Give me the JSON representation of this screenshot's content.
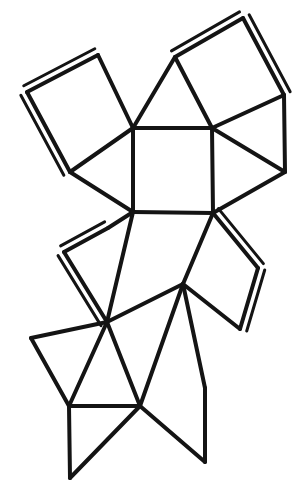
{
  "figure": {
    "canvas": {
      "width": 303,
      "height": 496
    },
    "background_color": "#ffffff",
    "line_color": "#141414",
    "line_width": 4,
    "flap_line_width": 3,
    "flap_offset": 7,
    "vertices": {
      "c_tl": [
        133,
        128
      ],
      "c_tr": [
        212,
        128
      ],
      "c_br": [
        213,
        213
      ],
      "c_bl": [
        133,
        212
      ],
      "tl_left": [
        27,
        92
      ],
      "tl_top": [
        98,
        55
      ],
      "tl_bottom": [
        70,
        172
      ],
      "tri_top_apex": [
        175,
        57
      ],
      "tr_top": [
        243,
        18
      ],
      "tr_right": [
        284,
        95
      ],
      "tr_bottom_right": [
        285,
        172
      ],
      "ml_left": [
        64,
        252
      ],
      "ml_top": [
        108,
        228
      ],
      "ml_bottom": [
        110,
        322
      ],
      "mid_left_hub": [
        107,
        322
      ],
      "mr_right": [
        258,
        268
      ],
      "mr_bottom": [
        240,
        329
      ],
      "low_hub": [
        183,
        284
      ],
      "bl_left": [
        31,
        338
      ],
      "bl_bottom": [
        69,
        406
      ],
      "bot_hub": [
        140,
        406
      ],
      "bot_left_pt": [
        70,
        478
      ],
      "bot_right_apex": [
        205,
        388
      ],
      "bot_right_low": [
        205,
        462
      ],
      "bot_mid": [
        140,
        462
      ]
    },
    "faces": [
      {
        "name": "central-square",
        "kind": "square",
        "points": "133,128 212,128 213,213 133,212"
      },
      {
        "name": "top-left-square-flap",
        "kind": "square-flap",
        "points": "27,92 98,55 133,128 70,172"
      },
      {
        "name": "top-triangle",
        "kind": "triangle",
        "points": "133,128 175,57 212,128"
      },
      {
        "name": "top-right-square-flap",
        "kind": "square-flap",
        "points": "175,57 243,18 284,95 212,128"
      },
      {
        "name": "right-triangle",
        "kind": "triangle",
        "points": "212,128 284,95 285,172"
      },
      {
        "name": "right-lower-triangle",
        "kind": "triangle",
        "points": "212,128 285,172 213,213"
      },
      {
        "name": "left-triangle",
        "kind": "triangle",
        "points": "70,172 133,128 133,212"
      },
      {
        "name": "mid-left-square-flap",
        "kind": "square-flap",
        "points": "64,252 108,228 133,212 107,322"
      },
      {
        "name": "mid-right-square-flap",
        "kind": "square-flap",
        "points": "213,213 258,268 240,329 183,284"
      },
      {
        "name": "lower-left-triangle",
        "kind": "triangle",
        "points": "107,322 133,212 183,284"
      },
      {
        "name": "lower-mid-triangle",
        "kind": "triangle",
        "points": "107,322 183,284 140,406"
      },
      {
        "name": "bottom-left-triangle",
        "kind": "triangle",
        "points": "31,338 107,322 69,406"
      },
      {
        "name": "bottom-small-triangle",
        "kind": "triangle",
        "points": "69,406 107,322 140,406"
      },
      {
        "name": "bottom-left-lower-triangle",
        "kind": "triangle",
        "points": "69,406 140,406 70,478"
      },
      {
        "name": "bottom-right-triangle",
        "kind": "triangle",
        "points": "140,406 183,284 205,388"
      },
      {
        "name": "bottom-right-lower-triangle",
        "kind": "triangle",
        "points": "140,406 205,388 205,462"
      }
    ],
    "edges": [
      {
        "name": "central-square-top",
        "path": "133,128 212,128"
      },
      {
        "name": "central-square-right",
        "path": "212,128 213,213"
      },
      {
        "name": "central-square-bottom",
        "path": "213,213 133,212"
      },
      {
        "name": "central-square-left",
        "path": "133,212 133,128"
      },
      {
        "name": "tl-square-a",
        "path": "27,92 98,55"
      },
      {
        "name": "tl-square-b",
        "path": "98,55 133,128"
      },
      {
        "name": "tl-square-c",
        "path": "133,128 70,172"
      },
      {
        "name": "tl-square-d",
        "path": "70,172 27,92"
      },
      {
        "name": "tl-left-triangle-edge",
        "path": "70,172 133,212"
      },
      {
        "name": "top-triangle-left",
        "path": "133,128 175,57"
      },
      {
        "name": "top-triangle-right",
        "path": "175,57 212,128"
      },
      {
        "name": "tr-square-a",
        "path": "175,57 243,18"
      },
      {
        "name": "tr-square-b",
        "path": "243,18 284,95"
      },
      {
        "name": "tr-square-c",
        "path": "284,95 212,128"
      },
      {
        "name": "right-triangle-outer",
        "path": "284,95 285,172"
      },
      {
        "name": "right-triangle-lower",
        "path": "285,172 213,213"
      },
      {
        "name": "right-triangle-diag",
        "path": "212,128 285,172"
      },
      {
        "name": "ml-square-a",
        "path": "133,212 108,228"
      },
      {
        "name": "ml-square-b",
        "path": "108,228 64,252"
      },
      {
        "name": "ml-square-c",
        "path": "64,252 107,322"
      },
      {
        "name": "ml-square-d",
        "path": "107,322 133,212"
      },
      {
        "name": "mr-square-a",
        "path": "213,213 258,268"
      },
      {
        "name": "mr-square-b",
        "path": "258,268 240,329"
      },
      {
        "name": "mr-square-c",
        "path": "240,329 183,284"
      },
      {
        "name": "mr-square-d",
        "path": "183,284 213,213"
      },
      {
        "name": "lower-left-diag",
        "path": "107,322 183,284"
      },
      {
        "name": "lower-mid-diag",
        "path": "183,284 140,406"
      },
      {
        "name": "lower-left-down",
        "path": "107,322 140,406"
      },
      {
        "name": "bl-triangle-top",
        "path": "31,338 107,322"
      },
      {
        "name": "bl-triangle-left",
        "path": "31,338 69,406"
      },
      {
        "name": "bl-triangle-right",
        "path": "69,406 107,322"
      },
      {
        "name": "bottom-horizontal",
        "path": "69,406 140,406"
      },
      {
        "name": "bottom-left-diag",
        "path": "69,406 70,478"
      },
      {
        "name": "bottom-left-diag2",
        "path": "70,478 140,406"
      },
      {
        "name": "bottom-right-apex-left",
        "path": "183,284 205,388"
      },
      {
        "name": "bottom-right-apex-down",
        "path": "205,388 205,462"
      },
      {
        "name": "bottom-right-bottom",
        "path": "140,406 205,462"
      }
    ],
    "flaps": [
      {
        "name": "top-left-flap-edge-1",
        "path": "27,92 98,55",
        "normal": [
          -0.46,
          -0.89
        ]
      },
      {
        "name": "top-left-flap-edge-2",
        "path": "27,92 70,172",
        "normal": [
          -0.88,
          0.47
        ]
      },
      {
        "name": "top-right-flap-edge-1",
        "path": "175,57 243,18",
        "normal": [
          -0.5,
          -0.87
        ]
      },
      {
        "name": "top-right-flap-edge-2",
        "path": "243,18 284,95",
        "normal": [
          0.88,
          -0.47
        ]
      },
      {
        "name": "mid-left-flap-edge-1",
        "path": "108,228 64,252",
        "normal": [
          -0.48,
          -0.88
        ]
      },
      {
        "name": "mid-left-flap-edge-2",
        "path": "64,252 107,322",
        "normal": [
          -0.85,
          0.52
        ]
      },
      {
        "name": "mid-right-flap-edge-1",
        "path": "213,213 258,268",
        "normal": [
          0.77,
          -0.63
        ]
      },
      {
        "name": "mid-right-flap-edge-2",
        "path": "258,268 240,329",
        "normal": [
          0.96,
          0.28
        ]
      }
    ]
  }
}
